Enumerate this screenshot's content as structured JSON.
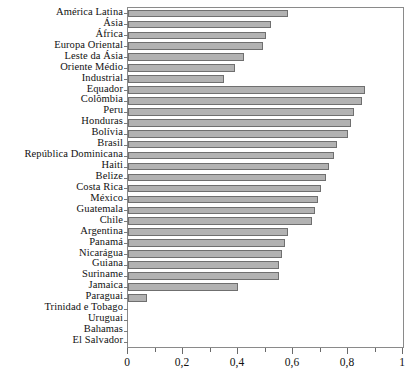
{
  "chart_data": {
    "type": "bar",
    "orientation": "horizontal",
    "title": "",
    "subtitle": "",
    "xlabel": "",
    "ylabel": "",
    "xlim": [
      0,
      1
    ],
    "ylim": null,
    "grid": false,
    "legend": null,
    "decimal_separator": ",",
    "bar_color": "#b2b2b2",
    "bar_edge_color": "#6f6f6f",
    "axis_color": "#8a8a8a",
    "x_ticks_major": [
      0,
      0.2,
      0.4,
      0.6,
      0.8,
      1
    ],
    "x_tick_labels": [
      "0",
      "0,2",
      "0,4",
      "0,6",
      "0,8",
      "1"
    ],
    "x_ticks_minor": [
      0.1,
      0.3,
      0.5,
      0.7,
      0.9
    ],
    "categories": [
      "América Latina",
      "Ásia",
      "África",
      "Europa Oriental",
      "Leste da Ásia",
      "Oriente Médio",
      "Industrial",
      "Equador",
      "Colômbia",
      "Peru",
      "Honduras",
      "Bolívia",
      "Brasil",
      "República Dominicana",
      "Haiti",
      "Belize",
      "Costa Rica",
      "México",
      "Guatemala",
      "Chile",
      "Argentina",
      "Panamá",
      "Nicarágua",
      "Guiana",
      "Suriname",
      "Jamaica",
      "Paraguai",
      "Trinidad e Tobago",
      "Uruguai",
      "Bahamas",
      "El Salvador"
    ],
    "values": [
      0.58,
      0.52,
      0.5,
      0.49,
      0.42,
      0.39,
      0.35,
      0.86,
      0.85,
      0.82,
      0.81,
      0.8,
      0.76,
      0.75,
      0.73,
      0.72,
      0.7,
      0.69,
      0.68,
      0.67,
      0.58,
      0.57,
      0.56,
      0.55,
      0.55,
      0.4,
      0.07,
      0.0,
      0.0,
      0.0,
      0.0
    ]
  }
}
